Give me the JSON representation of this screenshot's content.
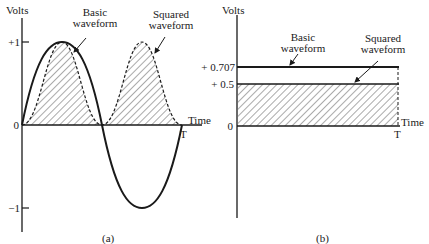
{
  "panel_a": {
    "y_label": "Volts",
    "x_label": "Time",
    "period_label": "T",
    "ticks": [
      "+1",
      "0",
      "−1"
    ],
    "basic_label_line1": "Basic",
    "basic_label_line2": "waveform",
    "squared_label_line1": "Squared",
    "squared_label_line2": "waveform",
    "caption": "(a)"
  },
  "panel_b": {
    "y_label": "Volts",
    "x_label": "Time",
    "period_label": "T",
    "ticks": [
      "+ 0.707",
      "+ 0.5",
      "0"
    ],
    "basic_label_line1": "Basic",
    "basic_label_line2": "waveform",
    "squared_label_line1": "Squared",
    "squared_label_line2": "waveform",
    "caption": "(b)"
  },
  "colors": {
    "ink": "#1a1a1a",
    "hatch": "#555555",
    "background": "#ffffff"
  }
}
